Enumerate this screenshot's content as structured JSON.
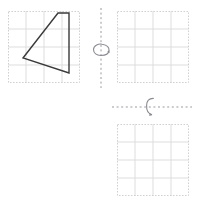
{
  "worksheet": {
    "width": 199,
    "height": 207,
    "background_color": "#ffffff",
    "description": "Geometry rotation worksheet: a quadrilateral on a square grid with two empty grids and two dashed rotation axes"
  },
  "colors": {
    "grid_line": "#d9d9d9",
    "grid_border": "#cccccc",
    "shape_stroke": "#3a3a3a",
    "axis_line": "#9a9aa0",
    "arrow_stroke": "#8a8a92"
  },
  "grids": [
    {
      "id": "source-grid",
      "label": "Original figure grid",
      "x": 8,
      "y": 11,
      "width": 72,
      "height": 72,
      "columns": 4,
      "rows": 4,
      "cell_size": 18,
      "has_shape": true
    },
    {
      "id": "answer-grid-top-right",
      "label": "Answer grid after vertical-axis rotation",
      "x": 117,
      "y": 11,
      "width": 72,
      "height": 72,
      "columns": 4,
      "rows": 4,
      "cell_size": 18,
      "has_shape": false
    },
    {
      "id": "answer-grid-bottom-right",
      "label": "Answer grid after horizontal-axis rotation",
      "x": 117,
      "y": 124,
      "width": 72,
      "height": 72,
      "columns": 4,
      "rows": 4,
      "cell_size": 18,
      "has_shape": false
    }
  ],
  "shape": {
    "name": "quadrilateral",
    "sides": 4,
    "closed": true,
    "fill": "none",
    "stroke_width": 1.4,
    "vertices": [
      {
        "x": 58,
        "y": 13
      },
      {
        "x": 69,
        "y": 13
      },
      {
        "x": 69,
        "y": 73
      },
      {
        "x": 23,
        "y": 58
      }
    ],
    "points_attr": "58,13 69,13 69,73 23,58"
  },
  "axes": [
    {
      "id": "vertical-axis",
      "orientation": "vertical",
      "x1": 101,
      "y1": 8,
      "x2": 101,
      "y2": 88,
      "dash": "2,2.6",
      "stroke_width": 1
    },
    {
      "id": "horizontal-axis",
      "orientation": "horizontal",
      "x1": 112,
      "y1": 107,
      "x2": 192,
      "y2": 107,
      "dash": "2,2.6",
      "stroke_width": 1
    }
  ],
  "rotation_arrows": [
    {
      "id": "vertical-axis-rotation-arrow",
      "axis": "vertical-axis",
      "center_x": 101,
      "center_y": 50,
      "orientation": "horizontal-ellipse",
      "arc_path": "M 93.5 49.5 C 93.5 45.2 99.0 43.4 102.2 44.2 C 106.6 44.9 109.4 47.2 109.0 50.6 C 108.7 53.4 105.4 55.4 101.0 55.5 C 96.6 55.6 93.5 53.2 93.5 49.5 Z",
      "arrowhead_path": "M 107.3 51.4 L 109.3 50.2 L 109.6 53.2 Z",
      "stroke_width": 1.1
    },
    {
      "id": "horizontal-axis-rotation-arrow",
      "axis": "horizontal-axis",
      "center_x": 150,
      "center_y": 107,
      "orientation": "vertical-arc",
      "arc_path": "M 153.3 98.4 C 149.2 98.3 146.8 101.2 146.6 105.4 C 146.4 110.2 148.3 113.6 151.6 114.6",
      "arrowhead_path": "M 149.6 113.0 L 152.3 114.9 L 149.3 116.0 Z",
      "stroke_width": 1.1
    }
  ]
}
